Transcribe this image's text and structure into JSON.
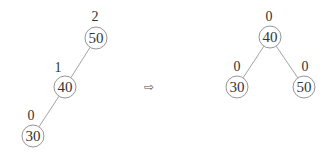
{
  "diagram": {
    "arrow_glyph": "⇨",
    "before": {
      "nodes": [
        {
          "id": "b50",
          "value": "50",
          "balance": "2",
          "cx": 96,
          "cy": 38,
          "lx": 95,
          "ly": 21
        },
        {
          "id": "b40",
          "value": "40",
          "balance": "1",
          "cx": 65,
          "cy": 87,
          "lx": 58,
          "ly": 72
        },
        {
          "id": "b30",
          "value": "30",
          "balance": "0",
          "cx": 33,
          "cy": 136,
          "lx": 31,
          "ly": 120
        }
      ],
      "edges": [
        [
          "b50",
          "b40"
        ],
        [
          "b40",
          "b30"
        ]
      ]
    },
    "after": {
      "nodes": [
        {
          "id": "a40",
          "value": "40",
          "balance": "0",
          "cx": 270,
          "cy": 37,
          "lx": 269,
          "ly": 21
        },
        {
          "id": "a30",
          "value": "30",
          "balance": "0",
          "cx": 237,
          "cy": 87,
          "lx": 237,
          "ly": 71
        },
        {
          "id": "a50",
          "value": "50",
          "balance": "0",
          "cx": 304,
          "cy": 87,
          "lx": 305,
          "ly": 71
        }
      ],
      "edges": [
        [
          "a40",
          "a30"
        ],
        [
          "a40",
          "a50"
        ]
      ]
    }
  }
}
